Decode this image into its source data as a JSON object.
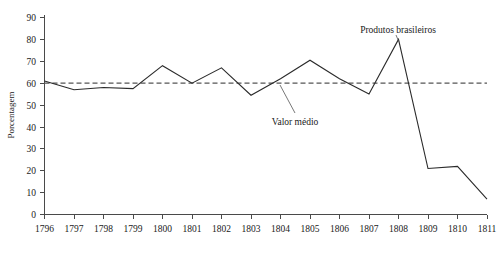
{
  "chart_data": {
    "type": "line",
    "title": "",
    "subtitle": "",
    "xlabel": "",
    "ylabel": "Porcentagem",
    "categories": [
      "1796",
      "1797",
      "1798",
      "1799",
      "1800",
      "1801",
      "1802",
      "1803",
      "1804",
      "1805",
      "1806",
      "1807",
      "1808",
      "1809",
      "1810",
      "1811"
    ],
    "x": [
      1796,
      1797,
      1798,
      1799,
      1800,
      1801,
      1802,
      1803,
      1804,
      1805,
      1806,
      1807,
      1808,
      1809,
      1810,
      1811
    ],
    "series": [
      {
        "name": "Produtos brasileiros",
        "values": [
          61,
          57,
          58,
          57.5,
          68,
          60,
          67,
          54.5,
          62,
          70.5,
          62,
          55,
          80,
          21,
          22,
          7
        ]
      }
    ],
    "reference_lines": [
      {
        "name": "Valor médio",
        "value": 60,
        "style": "dashed",
        "orientation": "horizontal"
      }
    ],
    "xlim": [
      1796,
      1811
    ],
    "ylim": [
      0,
      90
    ],
    "yticks": [
      0,
      10,
      20,
      30,
      40,
      50,
      60,
      70,
      80,
      90
    ],
    "ytick_labels": [
      "0",
      "10",
      "20",
      "30",
      "40",
      "50",
      "60",
      "70",
      "80",
      "90"
    ],
    "xticks": [
      1796,
      1797,
      1798,
      1799,
      1800,
      1801,
      1802,
      1803,
      1804,
      1805,
      1806,
      1807,
      1808,
      1809,
      1810,
      1811
    ],
    "xtick_labels": [
      "1796",
      "1797",
      "1798",
      "1799",
      "1800",
      "1801",
      "1802",
      "1803",
      "1804",
      "1805",
      "1806",
      "1807",
      "1808",
      "1809",
      "1810",
      "1811"
    ],
    "grid": false,
    "legend_position": "none",
    "annotations": [
      {
        "name": "series-annotation",
        "text": "Produtos brasileiros",
        "points_to_x": 1808,
        "points_to_y": 80
      },
      {
        "name": "mean-annotation",
        "text": "Valor médio",
        "points_to_x": 1803.6,
        "points_to_y": 60
      }
    ],
    "colors": {
      "data_line": "#2b2b2b",
      "mean_line": "#555555",
      "axis": "#4a4a4a",
      "text": "#1a1a1a",
      "background": "#ffffff"
    }
  },
  "labels": {
    "y_axis_title": "Porcentagem",
    "annotation_series": "Produtos brasileiros",
    "annotation_mean": "Valor médio"
  }
}
